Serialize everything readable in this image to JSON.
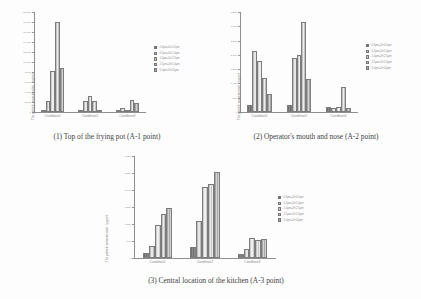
{
  "figure": {
    "panels": [
      {
        "id": "panel-1",
        "caption": "(1) Top of the frying pot (A-1 point)",
        "chart_data": {
          "type": "bar",
          "title": "",
          "xlabel": "",
          "ylabel": "The particle concentration（μg/m³）",
          "categories": [
            "Condition1",
            "Condition2",
            "Condition3"
          ],
          "ylim": [
            0,
            20000
          ],
          "yticks": [
            0,
            2000,
            4000,
            6000,
            8000,
            10000,
            12000,
            14000,
            16000,
            18000,
            20000
          ],
          "ytick_labels": [
            "0",
            "2,000",
            "4,000",
            "6,000",
            "8,000",
            "10,000",
            "12,000",
            "14,000",
            "16,000",
            "18,000",
            "20,000"
          ],
          "grid": false,
          "legend_position": "right",
          "series": [
            {
              "name": "0.3μm≤D<0.5μm",
              "values": [
                220,
                180,
                120
              ]
            },
            {
              "name": "0.5μm≤D<1.0μm",
              "values": [
                2300,
                2150,
                900
              ]
            },
            {
              "name": "1.0μm≤D<2.5μm",
              "values": [
                8300,
                3200,
                100
              ]
            },
            {
              "name": "2.5μm≤D<5.0μm",
              "values": [
                18100,
                2250,
                2350
              ]
            },
            {
              "name": "5.0μm≤D<10μm",
              "values": [
                8900,
                330,
                1800
              ]
            }
          ]
        }
      },
      {
        "id": "panel-2",
        "caption": "(2) Operator's mouth and nose (A-2 point)",
        "chart_data": {
          "type": "bar",
          "title": "",
          "xlabel": "",
          "ylabel": "The particle concentration（μg/m³）",
          "categories": [
            "Condition1",
            "Condition2",
            "Condition3"
          ],
          "ylim": [
            0,
            3500
          ],
          "yticks": [
            0,
            500,
            1000,
            1500,
            2000,
            2500,
            3000,
            3500
          ],
          "ytick_labels": [
            "0",
            "500",
            "1,000",
            "1,500",
            "2,000",
            "2,500",
            "3,000",
            "3,500"
          ],
          "grid": false,
          "legend_position": "right",
          "series": [
            {
              "name": "0.3μm≤D<0.5μm",
              "values": [
                260,
                230,
                170
              ]
            },
            {
              "name": "0.5μm≤D<1.0μm",
              "values": [
                2150,
                1880,
                130
              ]
            },
            {
              "name": "1.0μm≤D<2.5μm",
              "values": [
                1780,
                2000,
                180
              ]
            },
            {
              "name": "2.5μm≤D<5.0μm",
              "values": [
                1200,
                3140,
                880
              ]
            },
            {
              "name": "5.0μm≤D<10μm",
              "values": [
                620,
                1170,
                150
              ]
            }
          ]
        }
      },
      {
        "id": "panel-3",
        "caption": "(3) Central location of the kitchen (A-3 point)",
        "chart_data": {
          "type": "bar",
          "title": "",
          "xlabel": "",
          "ylabel": "The particle concentration（μg/m³）",
          "categories": [
            "Condition1",
            "Condition2",
            "Condition3"
          ],
          "ylim": [
            0,
            3000
          ],
          "yticks": [
            0,
            500,
            1000,
            1500,
            2000,
            2500,
            3000
          ],
          "ytick_labels": [
            "0",
            "500",
            "1,000",
            "1,500",
            "2,000",
            "2,500",
            "3,000"
          ],
          "grid": false,
          "legend_position": "right",
          "series": [
            {
              "name": "0.3μm≤D<0.5μm",
              "values": [
                160,
                310,
                120
              ]
            },
            {
              "name": "0.5μm≤D<1.0μm",
              "values": [
                340,
                1080,
                260
              ]
            },
            {
              "name": "1.0μm≤D<2.5μm",
              "values": [
                980,
                2080,
                580
              ]
            },
            {
              "name": "2.5μm≤D<5.0μm",
              "values": [
                1280,
                2170,
                520
              ]
            },
            {
              "name": "5.0μm≤D<10μm",
              "values": [
                1480,
                2520,
                570
              ]
            }
          ]
        }
      }
    ]
  },
  "style": {
    "series_colors": [
      "#7a7a7a",
      "#d8d8d8",
      "#e2e2e2",
      "#d0d0d0",
      "#b5b5b5"
    ]
  }
}
